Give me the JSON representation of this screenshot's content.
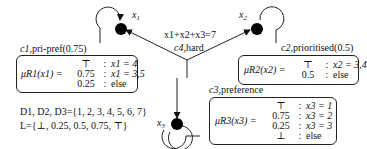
{
  "nodes": [
    {
      "id": "x1",
      "label": "x",
      "sub": "1"
    },
    {
      "id": "x2",
      "label": "x",
      "sub": "2"
    },
    {
      "id": "x3",
      "label": "x",
      "sub": "3"
    }
  ],
  "hard_constraint": {
    "expr": "x1+x2+x3=7",
    "name": "c4",
    "type": "hard"
  },
  "constraints": [
    {
      "name": "c1",
      "type": "pri-pref(0.75)",
      "function": "μR1(x1) =",
      "rows": [
        [
          "⊤",
          ":",
          "x1 = 4"
        ],
        [
          "0.75",
          ":",
          "x1 = 3,5"
        ],
        [
          "0.25",
          ":",
          "else"
        ]
      ]
    },
    {
      "name": "c2",
      "type": "prioritised(0.5)",
      "function": "μR2(x2) =",
      "rows": [
        [
          "⊤",
          ":",
          "x2 = 3,4"
        ],
        [
          "0.5",
          ":",
          "else"
        ]
      ]
    },
    {
      "name": "c3",
      "type": "preference",
      "function": "μR3(x3) =",
      "rows": [
        [
          "⊤",
          ":",
          "x3 = 1"
        ],
        [
          "0.75",
          ":",
          "x3 = 2"
        ],
        [
          "0.25",
          ":",
          "x3 = 3"
        ],
        [
          "⊥",
          ":",
          "else"
        ]
      ]
    }
  ],
  "domains": "D1, D2, D3={1, 2, 3, 4, 5, 6, 7}",
  "levels": "L={⊥, 0.25, 0.5, 0.75, ⊤}",
  "colors": {
    "ink": "#111111",
    "background": "#ffffff"
  }
}
